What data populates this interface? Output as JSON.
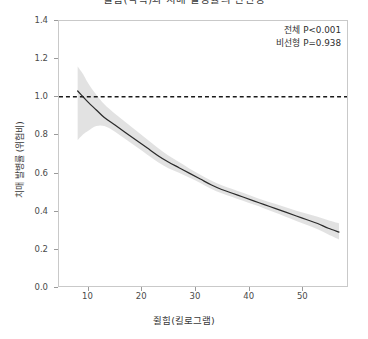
{
  "chart_data": {
    "type": "line",
    "title": "쥘힘(악력)과 치매 발병률의 연관성",
    "xlabel": "쥘힘(킬로그램)",
    "ylabel": "치매 발병률 (위험비)",
    "xlim": [
      4.5,
      58.5
    ],
    "ylim": [
      0.0,
      1.4
    ],
    "xticks": [
      10,
      20,
      30,
      40,
      50
    ],
    "xtick_labels": [
      "10",
      "20",
      "30",
      "40",
      "50"
    ],
    "yticks": [
      0.0,
      0.2,
      0.4,
      0.6,
      0.8,
      1.0,
      1.2,
      1.4
    ],
    "ytick_labels": [
      "0.0",
      "0.2",
      "0.4",
      "0.6",
      "0.8",
      "1.0",
      "1.2",
      "1.4"
    ],
    "grid": false,
    "legend": "none",
    "reference_line": {
      "orientation": "horizontal",
      "value": 1.0,
      "style": "dashed",
      "color": "#1a1a1a"
    },
    "annotations": [
      "전체 P<0.001",
      "비선형 P=0.938"
    ],
    "series": [
      {
        "name": "치매 발병률 (위험비)",
        "kind": "spline",
        "color": "#2b2b2b",
        "x": [
          8.0,
          9.0,
          10.0,
          11.5,
          13.0,
          15.0,
          17.0,
          19.0,
          21.0,
          23.0,
          25.0,
          27.0,
          29.0,
          31.0,
          33.0,
          35.0,
          37.0,
          39.0,
          41.0,
          43.0,
          45.0,
          47.0,
          49.0,
          51.0,
          53.0,
          55.0,
          57.0
        ],
        "values": [
          1.03,
          1.0,
          0.97,
          0.93,
          0.89,
          0.85,
          0.81,
          0.77,
          0.73,
          0.69,
          0.655,
          0.625,
          0.595,
          0.565,
          0.535,
          0.51,
          0.49,
          0.47,
          0.45,
          0.43,
          0.41,
          0.39,
          0.37,
          0.35,
          0.33,
          0.305,
          0.285
        ]
      },
      {
        "name": "95% 신뢰구간 상한",
        "kind": "ci-upper",
        "color": "#d0d0d0",
        "x": [
          8.0,
          9.0,
          10.0,
          11.5,
          13.0,
          15.0,
          17.0,
          19.0,
          21.0,
          23.0,
          25.0,
          27.0,
          29.0,
          31.0,
          33.0,
          35.0,
          37.0,
          39.0,
          41.0,
          43.0,
          45.0,
          47.0,
          49.0,
          51.0,
          53.0,
          55.0,
          57.0
        ],
        "values": [
          1.16,
          1.12,
          1.07,
          1.01,
          0.96,
          0.91,
          0.865,
          0.82,
          0.775,
          0.73,
          0.69,
          0.655,
          0.62,
          0.588,
          0.558,
          0.532,
          0.512,
          0.492,
          0.472,
          0.452,
          0.434,
          0.416,
          0.398,
          0.382,
          0.366,
          0.348,
          0.332
        ]
      },
      {
        "name": "95% 신뢰구간 하한",
        "kind": "ci-lower",
        "color": "#d0d0d0",
        "x": [
          8.0,
          9.0,
          10.0,
          11.5,
          13.0,
          15.0,
          17.0,
          19.0,
          21.0,
          23.0,
          25.0,
          27.0,
          29.0,
          31.0,
          33.0,
          35.0,
          37.0,
          39.0,
          41.0,
          43.0,
          45.0,
          47.0,
          49.0,
          51.0,
          53.0,
          55.0,
          57.0
        ],
        "values": [
          0.77,
          0.8,
          0.82,
          0.845,
          0.845,
          0.815,
          0.775,
          0.735,
          0.695,
          0.655,
          0.622,
          0.598,
          0.572,
          0.544,
          0.514,
          0.49,
          0.47,
          0.45,
          0.43,
          0.41,
          0.388,
          0.366,
          0.344,
          0.322,
          0.3,
          0.272,
          0.246
        ]
      }
    ]
  },
  "style": {
    "line_color": "#2b2b2b",
    "band_color": "#d2d2d2",
    "axis_color": "#c9c9c9",
    "tick_color": "#9a9a9a",
    "text_color": "#3a3a3a",
    "background": "#ffffff"
  }
}
